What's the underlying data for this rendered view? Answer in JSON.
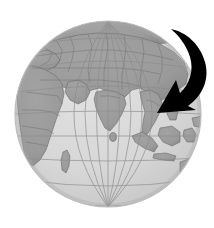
{
  "figure": {
    "background_color": "#ffffff",
    "width": 214,
    "height": 228
  },
  "globe": {
    "name": "earth-globe",
    "projection": "orthographic",
    "center_x": 108,
    "center_y": 114,
    "radius": 93,
    "ocean_color": "#d9d9d9",
    "land_color": "#9a9a9a",
    "border_color": "#6e6e6e",
    "graticule_color": "#8d8d8d",
    "outline_color": "#bdbdbd",
    "shading_color": "#b4b4b4",
    "graticule": {
      "meridian_spacing_degrees": 15,
      "parallel_spacing_degrees": 15,
      "visible": true
    },
    "center_longitude": 75,
    "center_latitude": 18,
    "regions": [
      {
        "name": "europe",
        "label": "Europe"
      },
      {
        "name": "africa",
        "label": "Africa"
      },
      {
        "name": "arabia",
        "label": "Arabian Peninsula"
      },
      {
        "name": "asia",
        "label": "Asia"
      },
      {
        "name": "india",
        "label": "India"
      },
      {
        "name": "sri-lanka",
        "label": "Sri Lanka"
      },
      {
        "name": "indochina",
        "label": "Indochina"
      },
      {
        "name": "indonesia",
        "label": "Indonesia"
      },
      {
        "name": "australia",
        "label": "Australia"
      },
      {
        "name": "arctic",
        "label": "Arctic"
      }
    ]
  },
  "arrow": {
    "name": "curved-pointer-arrow",
    "color": "#000000",
    "direction": "clockwise-sweep-down-left",
    "tail_x": 172,
    "tail_y": 30,
    "tip_x": 157,
    "tip_y": 112,
    "points_to": "Southeast Asia"
  }
}
